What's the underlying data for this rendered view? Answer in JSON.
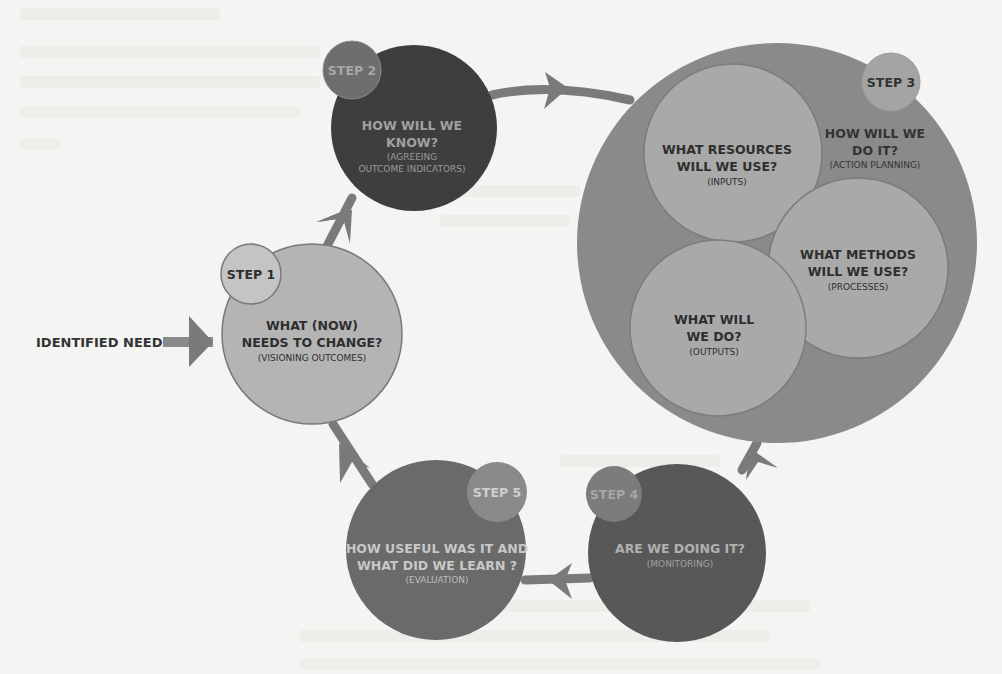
{
  "diagram": {
    "entry": {
      "label": "IDENTIFIED NEED"
    },
    "colors": {
      "background": "#f4f4f2",
      "arrow": "#7a7a7a",
      "light_circle": "#b4b4b4",
      "step1_small": "#c4c4c4",
      "step2_circle": "#3e3e3e",
      "step2_small": "#6e6e6e",
      "step3_outer": "#8a8a8a",
      "step3_inner": "#a8a8a8",
      "step3_small": "#a4a4a4",
      "step4_circle": "#585858",
      "step4_small": "#7c7c7c",
      "step5_circle": "#6a6a6a",
      "step5_small": "#8a8a8a"
    },
    "steps": [
      {
        "badge": "STEP 1",
        "title_line1": "WHAT (NOW)",
        "title_line2": "NEEDS TO CHANGE?",
        "subtitle": "(VISIONING OUTCOMES)"
      },
      {
        "badge": "STEP 2",
        "title_line1": "HOW WILL WE",
        "title_line2": "KNOW?",
        "subtitle_line1": "(AGREEING",
        "subtitle_line2": "OUTCOME INDICATORS)"
      },
      {
        "badge": "STEP 3",
        "title_line1": "HOW WILL WE",
        "title_line2": "DO IT?",
        "subtitle": "(ACTION PLANNING)",
        "sub_circles": [
          {
            "title_line1": "WHAT RESOURCES",
            "title_line2": "WILL WE USE?",
            "subtitle": "(INPUTS)"
          },
          {
            "title_line1": "WHAT METHODS",
            "title_line2": "WILL WE USE?",
            "subtitle": "(PROCESSES)"
          },
          {
            "title_line1": "WHAT WILL",
            "title_line2": "WE DO?",
            "subtitle": "(OUTPUTS)"
          }
        ]
      },
      {
        "badge": "STEP 4",
        "title_line1": "ARE WE DOING IT?",
        "subtitle": "(MONITORING)"
      },
      {
        "badge": "STEP 5",
        "title_line1": "HOW USEFUL WAS IT AND",
        "title_line2": "WHAT DID WE LEARN ?",
        "subtitle": "(EVALUATION)"
      }
    ]
  }
}
